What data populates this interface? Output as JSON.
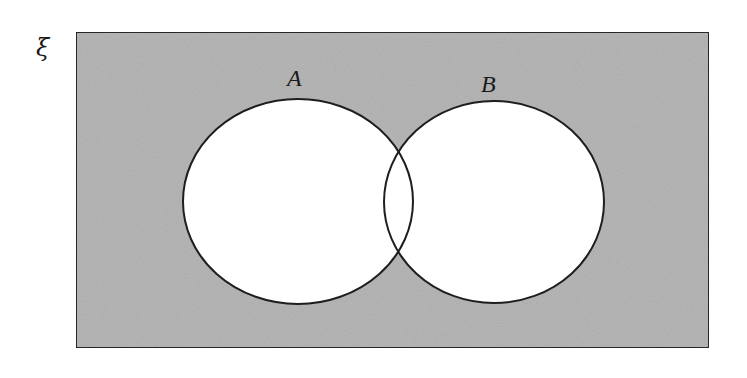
{
  "diagram": {
    "type": "venn",
    "universe": {
      "symbol": "ξ",
      "x": 76,
      "y": 32,
      "width": 633,
      "height": 316,
      "fill": "#b9b9b9",
      "stroke": "#2a2a2a"
    },
    "sets": [
      {
        "label": "A",
        "cx": 298,
        "cy": 201.5,
        "rx": 115,
        "ry": 102.5,
        "fill": "#ffffff",
        "label_x": 296,
        "label_y": 86
      },
      {
        "label": "B",
        "cx": 494,
        "cy": 202,
        "rx": 110,
        "ry": 101,
        "fill": "#ffffff",
        "label_x": 490,
        "label_y": 92
      }
    ],
    "shaded_region": "complement of A ∪ B",
    "stroke_color": "#1e1e1e"
  }
}
